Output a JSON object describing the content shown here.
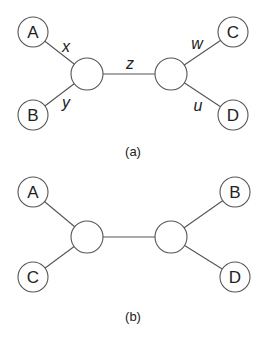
{
  "diagrams": [
    {
      "caption": "(a)",
      "leaves": [
        {
          "label": "A",
          "x": 33,
          "y": 32
        },
        {
          "label": "B",
          "x": 33,
          "y": 115
        },
        {
          "label": "C",
          "x": 233,
          "y": 32
        },
        {
          "label": "D",
          "x": 233,
          "y": 115
        }
      ],
      "internal": [
        {
          "x": 87,
          "y": 74
        },
        {
          "x": 171,
          "y": 74
        }
      ],
      "edge_labels": [
        {
          "label": "x",
          "x": 66,
          "y": 46
        },
        {
          "label": "y",
          "x": 66,
          "y": 102
        },
        {
          "label": "z",
          "x": 130,
          "y": 63
        },
        {
          "label": "w",
          "x": 197,
          "y": 43
        },
        {
          "label": "u",
          "x": 198,
          "y": 105
        }
      ]
    },
    {
      "caption": "(b)",
      "leaves": [
        {
          "label": "A",
          "x": 33,
          "y": 192
        },
        {
          "label": "C",
          "x": 33,
          "y": 277
        },
        {
          "label": "B",
          "x": 235,
          "y": 192
        },
        {
          "label": "D",
          "x": 235,
          "y": 277
        }
      ],
      "internal": [
        {
          "x": 87,
          "y": 237
        },
        {
          "x": 171,
          "y": 237
        }
      ],
      "edge_labels": []
    }
  ]
}
